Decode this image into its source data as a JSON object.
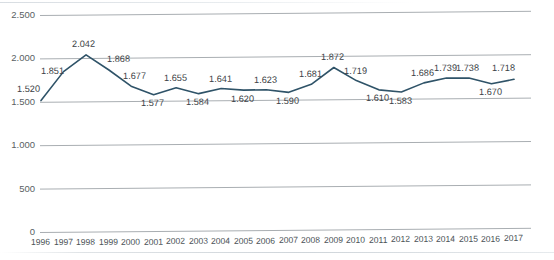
{
  "chart_data": {
    "type": "line",
    "title": "",
    "xlabel": "",
    "ylabel": "",
    "categories": [
      "1996",
      "1997",
      "1998",
      "1999",
      "2000",
      "2001",
      "2002",
      "2003",
      "2004",
      "2005",
      "2006",
      "2007",
      "2008",
      "2009",
      "2010",
      "2011",
      "2012",
      "2013",
      "2014",
      "2015",
      "2016",
      "2017"
    ],
    "values": [
      1520,
      1851,
      2042,
      1868,
      1677,
      1577,
      1655,
      1584,
      1641,
      1620,
      1623,
      1590,
      1681,
      1872,
      1719,
      1610,
      1583,
      1686,
      1739,
      1738,
      1670,
      1718
    ],
    "data_labels": [
      "1.520",
      "1.851",
      "2.042",
      "1.868",
      "1.677",
      "1.577",
      "1.655",
      "1.584",
      "1.641",
      "1.620",
      "1.623",
      "1.590",
      "1.681",
      "1.872",
      "1.719",
      "1.610",
      "1.583",
      "1.686",
      "1.739",
      "1.738",
      "1.670",
      "1.718"
    ],
    "ylim": [
      0,
      2500
    ],
    "yticks": [
      0,
      500,
      1000,
      1500,
      2000,
      2500
    ],
    "ytick_labels": [
      "0",
      "500",
      "1.000",
      "1.500",
      "2.000",
      "2.500"
    ],
    "grid": true,
    "legend": "none",
    "series": [
      {
        "name": "series-1",
        "color": "#2f5368",
        "values": [
          1520,
          1851,
          2042,
          1868,
          1677,
          1577,
          1655,
          1584,
          1641,
          1620,
          1623,
          1590,
          1681,
          1872,
          1719,
          1610,
          1583,
          1686,
          1739,
          1738,
          1670,
          1718
        ]
      }
    ]
  },
  "colors": {
    "line": "#2f5368",
    "gridline": "#a9aeb2",
    "axis_text": "#5a5f63",
    "label_text": "#3b4145",
    "background": "#ffffff"
  }
}
